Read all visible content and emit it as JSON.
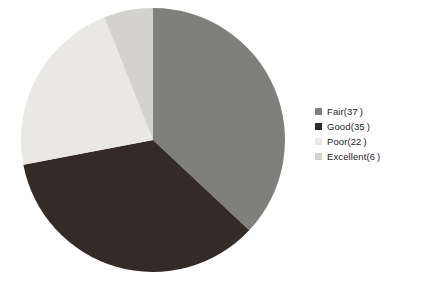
{
  "chart_data": {
    "type": "pie",
    "title": "",
    "categories": [
      "Fair",
      "Good",
      "Poor",
      "Excellent"
    ],
    "values": [
      37,
      35,
      22,
      6
    ],
    "units": "percent",
    "labels": [
      "Fair(37 )",
      "Good(35 )",
      "Poor(22 )",
      "Excellent(6 )"
    ],
    "colors": [
      "#7f7f7c",
      "#332b26",
      "#e9e8e4",
      "#d3d2ce"
    ],
    "start_angle_deg": 0,
    "direction": "clockwise",
    "legend_position": "right",
    "grid": false,
    "xlabel": "",
    "ylabel": ""
  },
  "legend": {
    "items": [
      {
        "label": "Fair(37 )",
        "name": "fair",
        "color": "#7f7f7c",
        "value": 37
      },
      {
        "label": "Good(35 )",
        "name": "good",
        "color": "#332b26",
        "value": 35
      },
      {
        "label": "Poor(22 )",
        "name": "poor",
        "color": "#e9e8e4",
        "value": 22
      },
      {
        "label": "Excellent(6 )",
        "name": "excellent",
        "color": "#d3d2ce",
        "value": 6
      }
    ]
  },
  "pie": {
    "center_x": 153,
    "center_y": 140,
    "radius": 132,
    "background": "#ffffff"
  }
}
